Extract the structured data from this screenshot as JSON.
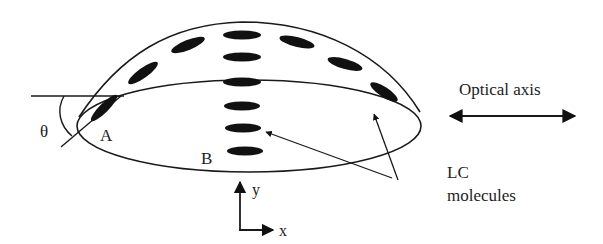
{
  "diagram": {
    "labels": {
      "theta": "θ",
      "point_a": "A",
      "point_b": "B",
      "axis_y": "y",
      "axis_x": "x",
      "optical_axis": "Optical axis",
      "lc_line1": "LC",
      "lc_line2": "molecules"
    },
    "colors": {
      "stroke": "#1a1a1a",
      "fill": "#111111",
      "text": "#222222",
      "background": "#ffffff"
    }
  }
}
